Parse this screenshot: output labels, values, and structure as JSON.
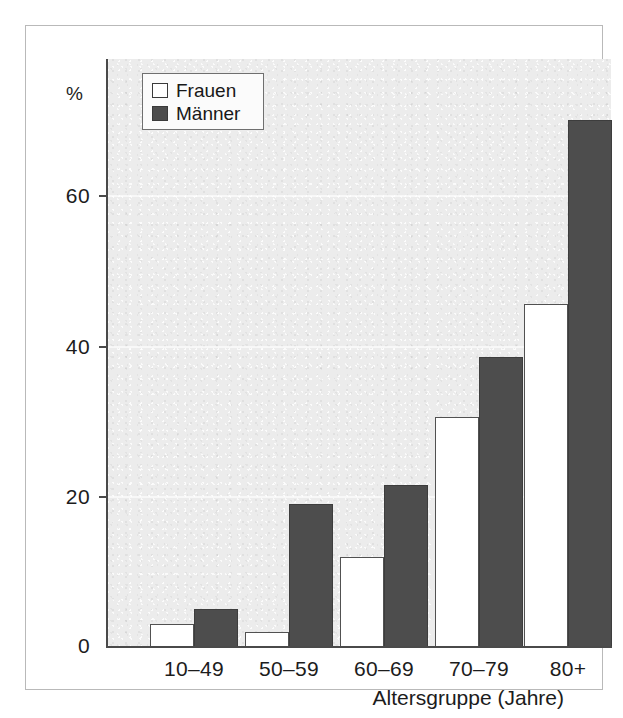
{
  "chart_data": {
    "type": "bar",
    "title": "",
    "xlabel": "Altersgruppe (Jahre)",
    "ylabel": "%",
    "categories": [
      "10–49",
      "50–59",
      "60–69",
      "70–79",
      "80+"
    ],
    "series": [
      {
        "name": "Frauen",
        "color": "#ffffff",
        "values": [
          3,
          2,
          12,
          30.5,
          45.5
        ]
      },
      {
        "name": "Männer",
        "color": "#4d4d4d",
        "values": [
          5,
          19,
          21.5,
          38.5,
          70
        ]
      }
    ],
    "ylim": [
      0,
      76
    ],
    "yticks": [
      0,
      20,
      40,
      60
    ],
    "ytick_labels": [
      "0",
      "20",
      "40",
      "60"
    ],
    "grid": true,
    "legend_position": "top-left",
    "legend_entries": [
      "Frauen",
      "Männer"
    ]
  },
  "axis": {
    "y_unit": "%",
    "y_tick_labels": [
      "60",
      "40",
      "20",
      "0"
    ],
    "x_tick_labels": [
      "10–49",
      "50–59",
      "60–69",
      "70–79",
      "80+"
    ],
    "x_title": "Altersgruppe (Jahre)"
  },
  "legend": {
    "frauen_label": "Frauen",
    "maenner_label": "Männer"
  },
  "colors": {
    "bar_frauen": "#ffffff",
    "bar_maenner": "#4d4d4d",
    "plot_background": "#ececec",
    "axis": "#4a4a4a"
  }
}
